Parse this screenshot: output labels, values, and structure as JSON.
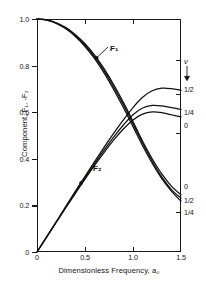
{
  "chart_data": {
    "type": "line",
    "title": "",
    "xlabel": "Dimensionless Frequency, a₀",
    "ylabel": "Component, F₁, -F₂",
    "xlim": [
      0,
      1.5
    ],
    "ylim": [
      0,
      1.0
    ],
    "grid": false,
    "legend_position": "right-edge-endpoint-labels",
    "parameter_name": "ν",
    "parameter_marker": "arrow-down",
    "xticks": [
      {
        "value": 0,
        "label": "0"
      },
      {
        "value": 0.5,
        "label": "0.5"
      },
      {
        "value": 1.0,
        "label": "1.0"
      },
      {
        "value": 1.5,
        "label": "1.5"
      }
    ],
    "yticks": [
      {
        "value": 0,
        "label": "0"
      },
      {
        "value": 0.2,
        "label": "0.2"
      },
      {
        "value": 0.4,
        "label": "0.4"
      },
      {
        "value": 0.6,
        "label": "0.6"
      },
      {
        "value": 0.8,
        "label": "0.8"
      },
      {
        "value": 1.0,
        "label": "1.0"
      }
    ],
    "x": [
      0,
      0.1,
      0.2,
      0.3,
      0.4,
      0.5,
      0.6,
      0.7,
      0.8,
      0.9,
      1.0,
      1.1,
      1.2,
      1.3,
      1.4,
      1.5
    ],
    "series": [
      {
        "name": "F1_nu_0",
        "component": "F₁",
        "nu": "0",
        "endpoint_label": "0",
        "values": [
          1.0,
          0.996,
          0.984,
          0.963,
          0.933,
          0.894,
          0.845,
          0.786,
          0.718,
          0.642,
          0.56,
          0.475,
          0.4,
          0.335,
          0.283,
          0.245
        ]
      },
      {
        "name": "F1_nu_1/4",
        "component": "F₁",
        "nu": "1/4",
        "endpoint_label": "1/4",
        "values": [
          1.0,
          0.995,
          0.981,
          0.958,
          0.925,
          0.882,
          0.83,
          0.768,
          0.697,
          0.62,
          0.538,
          0.456,
          0.381,
          0.315,
          0.261,
          0.218
        ]
      },
      {
        "name": "F1_nu_1/2",
        "component": "F₁",
        "nu": "1/2",
        "endpoint_label": "1/2",
        "values": [
          1.0,
          0.996,
          0.983,
          0.961,
          0.929,
          0.888,
          0.837,
          0.777,
          0.708,
          0.632,
          0.551,
          0.468,
          0.39,
          0.322,
          0.268,
          0.231
        ]
      },
      {
        "name": "F2_nu_1/2",
        "component": "-F₂",
        "nu": "1/2",
        "endpoint_label": "1/2",
        "values": [
          0.0,
          0.065,
          0.13,
          0.196,
          0.261,
          0.325,
          0.388,
          0.45,
          0.51,
          0.567,
          0.62,
          0.664,
          0.692,
          0.703,
          0.701,
          0.694
        ]
      },
      {
        "name": "F2_nu_1/4",
        "component": "-F₂",
        "nu": "1/4",
        "endpoint_label": "1/4",
        "values": [
          0.0,
          0.064,
          0.128,
          0.192,
          0.255,
          0.318,
          0.379,
          0.438,
          0.494,
          0.545,
          0.589,
          0.618,
          0.629,
          0.627,
          0.62,
          0.612
        ]
      },
      {
        "name": "F2_nu_0",
        "component": "-F₂",
        "nu": "0",
        "endpoint_label": "0",
        "values": [
          0.0,
          0.064,
          0.127,
          0.19,
          0.252,
          0.313,
          0.372,
          0.428,
          0.481,
          0.528,
          0.567,
          0.592,
          0.601,
          0.598,
          0.589,
          0.58
        ]
      }
    ],
    "annotations": [
      {
        "text": "F₁",
        "kind": "curve-label",
        "points_to_x": 0.62,
        "points_to_y": 0.833
      },
      {
        "text": "F₂",
        "kind": "curve-label",
        "points_to_x": 0.46,
        "points_to_y": 0.296
      }
    ],
    "right_edge_labels_upper": [
      "1/2",
      "1/4",
      "0"
    ],
    "right_edge_labels_lower": [
      "0",
      "1/2",
      "1/4"
    ],
    "colors": {
      "curve": "#101010",
      "axis": "#1a1a1a",
      "background": "#ffffff"
    }
  }
}
